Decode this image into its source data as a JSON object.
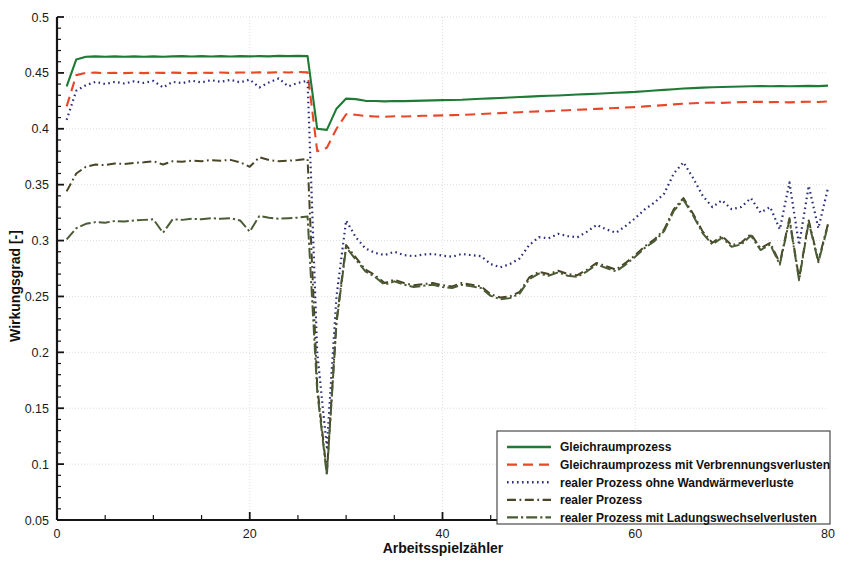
{
  "chart_data": {
    "type": "line",
    "title": "",
    "xlabel": "Arbeitsspielzähler",
    "ylabel": "Wirkungsgrad [-]",
    "xlim": [
      0,
      80
    ],
    "ylim": [
      0.05,
      0.5
    ],
    "xticks": [
      0,
      20,
      40,
      60,
      80
    ],
    "xtick_labels": [
      "0",
      "20",
      "40",
      "60",
      "80"
    ],
    "yticks": [
      0.05,
      0.1,
      0.15,
      0.2,
      0.25,
      0.3,
      0.35,
      0.4,
      0.45,
      0.5
    ],
    "ytick_labels": [
      "0.05",
      "0.1",
      "0.15",
      "0.2",
      "0.25",
      "0.3",
      "0.35",
      "0.4",
      "0.45",
      "0.5"
    ],
    "grid": true,
    "grid_axis": "y",
    "legend_position": "lower right",
    "minor_ticks": true,
    "x": [
      1,
      2,
      3,
      4,
      5,
      6,
      7,
      8,
      9,
      10,
      11,
      12,
      13,
      14,
      15,
      16,
      17,
      18,
      19,
      20,
      21,
      22,
      23,
      24,
      25,
      26,
      27,
      28,
      29,
      30,
      31,
      32,
      33,
      34,
      35,
      36,
      37,
      38,
      39,
      40,
      41,
      42,
      43,
      44,
      45,
      46,
      47,
      48,
      49,
      50,
      51,
      52,
      53,
      54,
      55,
      56,
      57,
      58,
      59,
      60,
      61,
      62,
      63,
      64,
      65,
      66,
      67,
      68,
      69,
      70,
      71,
      72,
      73,
      74,
      75,
      76,
      77,
      78,
      79,
      80
    ],
    "series": [
      {
        "name": "Gleichraumprozess",
        "color": "#1f7a36",
        "style": "solid",
        "width": 2.1,
        "values": [
          0.438,
          0.462,
          0.4645,
          0.4648,
          0.4645,
          0.4648,
          0.4645,
          0.4648,
          0.4645,
          0.4648,
          0.4645,
          0.4648,
          0.465,
          0.4646,
          0.465,
          0.4647,
          0.465,
          0.4646,
          0.465,
          0.4648,
          0.465,
          0.4648,
          0.4652,
          0.465,
          0.4652,
          0.465,
          0.4,
          0.399,
          0.418,
          0.427,
          0.4265,
          0.425,
          0.4248,
          0.4245,
          0.4248,
          0.4247,
          0.425,
          0.4252,
          0.4254,
          0.4256,
          0.4258,
          0.426,
          0.4264,
          0.4268,
          0.4272,
          0.4276,
          0.428,
          0.4284,
          0.4288,
          0.4292,
          0.4295,
          0.4298,
          0.4302,
          0.4306,
          0.431,
          0.4314,
          0.4318,
          0.4322,
          0.4326,
          0.433,
          0.4336,
          0.4342,
          0.4348,
          0.4354,
          0.436,
          0.4364,
          0.4368,
          0.4372,
          0.4374,
          0.4376,
          0.4378,
          0.438,
          0.4382,
          0.438,
          0.4382,
          0.438,
          0.4382,
          0.4384,
          0.4382,
          0.4386
        ]
      },
      {
        "name": "Gleichraumprozess mit Verbrennungsverlusten",
        "color": "#e8472a",
        "style": "dashed",
        "width": 2.1,
        "values": [
          0.42,
          0.448,
          0.45,
          0.4502,
          0.4498,
          0.45,
          0.4498,
          0.4502,
          0.4498,
          0.4502,
          0.45,
          0.4502,
          0.45,
          0.4498,
          0.4502,
          0.45,
          0.4504,
          0.45,
          0.4504,
          0.4502,
          0.4505,
          0.4502,
          0.4506,
          0.4504,
          0.4508,
          0.4505,
          0.38,
          0.383,
          0.4,
          0.413,
          0.4125,
          0.4115,
          0.411,
          0.4108,
          0.4112,
          0.411,
          0.4113,
          0.4116,
          0.4118,
          0.412,
          0.4122,
          0.4124,
          0.4128,
          0.4132,
          0.4136,
          0.414,
          0.4144,
          0.4148,
          0.4152,
          0.4156,
          0.4158,
          0.4162,
          0.4166,
          0.417,
          0.4174,
          0.4178,
          0.4182,
          0.4186,
          0.419,
          0.4194,
          0.42,
          0.4206,
          0.4212,
          0.4218,
          0.4224,
          0.4228,
          0.4232,
          0.4234,
          0.4232,
          0.4236,
          0.4238,
          0.424,
          0.4242,
          0.4238,
          0.424,
          0.4236,
          0.424,
          0.4242,
          0.424,
          0.4244
        ]
      },
      {
        "name": "realer Prozess ohne Wandwärmeverluste",
        "color": "#2b2f7a",
        "style": "dotted",
        "width": 2.2,
        "values": [
          0.408,
          0.434,
          0.439,
          0.442,
          0.44,
          0.442,
          0.4405,
          0.4425,
          0.441,
          0.4428,
          0.437,
          0.442,
          0.4408,
          0.443,
          0.4415,
          0.4435,
          0.442,
          0.4438,
          0.4415,
          0.444,
          0.437,
          0.4415,
          0.445,
          0.438,
          0.441,
          0.443,
          0.2,
          0.115,
          0.25,
          0.318,
          0.303,
          0.293,
          0.289,
          0.287,
          0.29,
          0.287,
          0.286,
          0.2875,
          0.288,
          0.2865,
          0.2855,
          0.288,
          0.287,
          0.286,
          0.279,
          0.276,
          0.279,
          0.284,
          0.296,
          0.303,
          0.302,
          0.306,
          0.304,
          0.303,
          0.308,
          0.314,
          0.31,
          0.307,
          0.313,
          0.32,
          0.328,
          0.334,
          0.342,
          0.36,
          0.37,
          0.356,
          0.34,
          0.33,
          0.336,
          0.328,
          0.33,
          0.338,
          0.325,
          0.33,
          0.31,
          0.352,
          0.296,
          0.349,
          0.311,
          0.347
        ]
      },
      {
        "name": "realer Prozess",
        "color": "#4a4527",
        "style": "dashdot",
        "width": 2.0,
        "values": [
          0.344,
          0.36,
          0.366,
          0.368,
          0.3675,
          0.369,
          0.3685,
          0.3695,
          0.37,
          0.371,
          0.368,
          0.371,
          0.3705,
          0.3715,
          0.371,
          0.372,
          0.3715,
          0.3722,
          0.37,
          0.366,
          0.3745,
          0.372,
          0.371,
          0.3715,
          0.372,
          0.373,
          0.17,
          0.092,
          0.228,
          0.296,
          0.285,
          0.274,
          0.269,
          0.262,
          0.265,
          0.262,
          0.26,
          0.261,
          0.262,
          0.26,
          0.259,
          0.262,
          0.2605,
          0.259,
          0.252,
          0.249,
          0.25,
          0.254,
          0.267,
          0.272,
          0.27,
          0.273,
          0.27,
          0.269,
          0.274,
          0.28,
          0.277,
          0.274,
          0.28,
          0.287,
          0.295,
          0.301,
          0.31,
          0.328,
          0.338,
          0.324,
          0.308,
          0.298,
          0.304,
          0.296,
          0.298,
          0.306,
          0.293,
          0.298,
          0.28,
          0.32,
          0.266,
          0.318,
          0.282,
          0.315
        ]
      },
      {
        "name": "realer Prozess mit Ladungswechselverlusten",
        "color": "#4a5c35",
        "style": "dashdotlight",
        "width": 2.0,
        "values": [
          0.301,
          0.311,
          0.315,
          0.3165,
          0.316,
          0.3175,
          0.317,
          0.318,
          0.3185,
          0.319,
          0.307,
          0.319,
          0.3185,
          0.3195,
          0.319,
          0.32,
          0.3195,
          0.32,
          0.318,
          0.308,
          0.322,
          0.3205,
          0.3195,
          0.32,
          0.3205,
          0.3215,
          0.165,
          0.09,
          0.226,
          0.294,
          0.283,
          0.2725,
          0.2675,
          0.2605,
          0.2635,
          0.2605,
          0.2585,
          0.2595,
          0.2605,
          0.2585,
          0.2575,
          0.2605,
          0.259,
          0.2575,
          0.2505,
          0.2475,
          0.2485,
          0.2525,
          0.2655,
          0.2705,
          0.2685,
          0.2715,
          0.2685,
          0.2675,
          0.2725,
          0.2785,
          0.2755,
          0.2725,
          0.2785,
          0.2855,
          0.2935,
          0.2995,
          0.3085,
          0.3265,
          0.3365,
          0.3225,
          0.3065,
          0.2965,
          0.3025,
          0.2945,
          0.2965,
          0.3045,
          0.2915,
          0.2965,
          0.2785,
          0.3185,
          0.2645,
          0.3165,
          0.2805,
          0.3135
        ]
      }
    ]
  },
  "legend": {
    "items": [
      {
        "label": "Gleichraumprozess"
      },
      {
        "label": "Gleichraumprozess mit Verbrennungsverlusten"
      },
      {
        "label": "realer Prozess ohne Wandwärmeverluste"
      },
      {
        "label": "realer Prozess"
      },
      {
        "label": "realer Prozess mit Ladungswechselverlusten"
      }
    ]
  },
  "colors": {
    "background": "#ffffff",
    "axis": "#151515",
    "grid": "#dedede",
    "green": "#1f7a36",
    "red": "#e8472a",
    "blue": "#2b2f7a",
    "brown": "#4a4527",
    "olive": "#4a5c35"
  }
}
